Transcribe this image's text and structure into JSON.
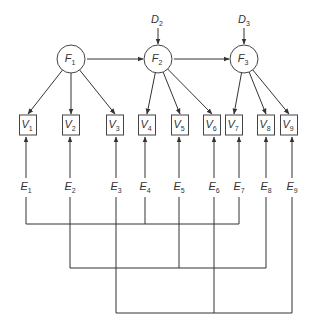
{
  "diagram": {
    "type": "structural-equation-model",
    "factors": [
      {
        "id": "F1",
        "letter": "F",
        "sub": "1",
        "cx": 71,
        "cy": 59
      },
      {
        "id": "F2",
        "letter": "F",
        "sub": "2",
        "cx": 158,
        "cy": 59
      },
      {
        "id": "F3",
        "letter": "F",
        "sub": "3",
        "cx": 244,
        "cy": 59
      }
    ],
    "disturbances": [
      {
        "id": "D2",
        "letter": "D",
        "sub": "2",
        "x": 157,
        "y": 23,
        "target": "F2"
      },
      {
        "id": "D3",
        "letter": "D",
        "sub": "3",
        "x": 244,
        "y": 23,
        "target": "F3"
      }
    ],
    "variables": [
      {
        "id": "V1",
        "letter": "V",
        "sub": "1",
        "cx": 28,
        "factor": "F1"
      },
      {
        "id": "V2",
        "letter": "V",
        "sub": "2",
        "cx": 71,
        "factor": "F1"
      },
      {
        "id": "V3",
        "letter": "V",
        "sub": "3",
        "cx": 115,
        "factor": "F1"
      },
      {
        "id": "V4",
        "letter": "V",
        "sub": "4",
        "cx": 147,
        "factor": "F2"
      },
      {
        "id": "V5",
        "letter": "V",
        "sub": "5",
        "cx": 180,
        "factor": "F2"
      },
      {
        "id": "V6",
        "letter": "V",
        "sub": "6",
        "cx": 212,
        "factor": "F2"
      },
      {
        "id": "V7",
        "letter": "V",
        "sub": "7",
        "cx": 234,
        "factor": "F3"
      },
      {
        "id": "V8",
        "letter": "V",
        "sub": "8",
        "cx": 266,
        "factor": "F3"
      },
      {
        "id": "V9",
        "letter": "V",
        "sub": "9",
        "cx": 289,
        "factor": "F3"
      }
    ],
    "errors": [
      {
        "id": "E1",
        "letter": "E",
        "sub": "1",
        "cx": 26,
        "target": "V1"
      },
      {
        "id": "E2",
        "letter": "E",
        "sub": "2",
        "cx": 70,
        "target": "V2"
      },
      {
        "id": "E3",
        "letter": "E",
        "sub": "3",
        "cx": 116,
        "target": "V3"
      },
      {
        "id": "E4",
        "letter": "E",
        "sub": "4",
        "cx": 145,
        "target": "V4"
      },
      {
        "id": "E5",
        "letter": "E",
        "sub": "5",
        "cx": 179,
        "target": "V5"
      },
      {
        "id": "E6",
        "letter": "E",
        "sub": "6",
        "cx": 214,
        "target": "V6"
      },
      {
        "id": "E7",
        "letter": "E",
        "sub": "7",
        "cx": 239,
        "target": "V7"
      },
      {
        "id": "E8",
        "letter": "E",
        "sub": "8",
        "cx": 266,
        "target": "V8"
      },
      {
        "id": "E9",
        "letter": "E",
        "sub": "9",
        "cx": 292,
        "target": "V9"
      }
    ],
    "paths": [
      {
        "from": "F1",
        "to": "F2"
      },
      {
        "from": "F2",
        "to": "F3"
      }
    ],
    "correlated_error_groups": [
      {
        "members": [
          "E1",
          "E4",
          "E7"
        ],
        "y": 224
      },
      {
        "members": [
          "E2",
          "E5",
          "E8"
        ],
        "y": 268
      },
      {
        "members": [
          "E3",
          "E6",
          "E9"
        ],
        "y": 313
      }
    ]
  }
}
